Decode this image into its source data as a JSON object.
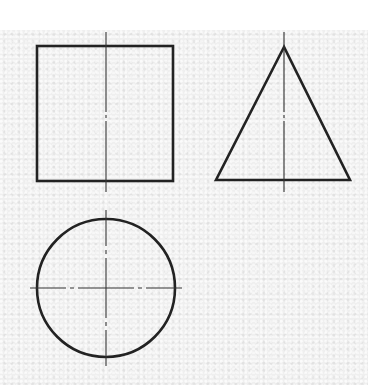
{
  "drawing": {
    "type": "orthographic three-view projection (cone)",
    "colors": {
      "paper": "#efefef",
      "margin": "#ffffff",
      "line": "#222222",
      "centerline": "#333333"
    },
    "views": [
      {
        "name": "front-view",
        "shape": "square",
        "x": 37,
        "y": 46,
        "width": 136,
        "height": 135,
        "centerlines": [
          {
            "orientation": "vertical",
            "x": 106,
            "y1": 32,
            "y2": 192,
            "dash": "dash-dot"
          }
        ]
      },
      {
        "name": "side-view",
        "shape": "triangle",
        "apex": [
          284,
          47
        ],
        "base_left": [
          216,
          180
        ],
        "base_right": [
          350,
          180
        ],
        "centerlines": [
          {
            "orientation": "vertical",
            "x": 284,
            "y1": 32,
            "y2": 192,
            "dash": "dash-dot"
          }
        ]
      },
      {
        "name": "top-view",
        "shape": "circle",
        "cx": 106,
        "cy": 288,
        "r": 69,
        "centerlines": [
          {
            "orientation": "vertical",
            "x": 106,
            "y1": 210,
            "y2": 366,
            "dash": "dash-dot"
          },
          {
            "orientation": "horizontal",
            "y": 288,
            "x1": 30,
            "x2": 182,
            "dash": "dash-dot"
          }
        ]
      }
    ]
  }
}
